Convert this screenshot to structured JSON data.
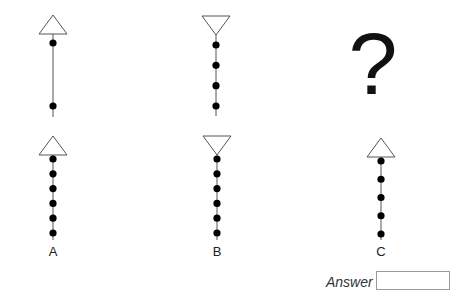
{
  "puzzle": {
    "question_mark": "?",
    "sequence": [
      {
        "id": "seq-1",
        "triangle": "up",
        "dots": 2,
        "dot_arrangement": "spread"
      },
      {
        "id": "seq-2",
        "triangle": "down",
        "dots": 4,
        "dot_arrangement": "even"
      }
    ],
    "options": [
      {
        "label": "A",
        "triangle": "up",
        "dots": 6
      },
      {
        "label": "B",
        "triangle": "down",
        "dots": 6
      },
      {
        "label": "C",
        "triangle": "up",
        "dots": 5
      }
    ]
  },
  "answer": {
    "label": "Answer",
    "value": ""
  },
  "colors": {
    "stroke": "#555555",
    "dot": "#000000",
    "triangle_fill": "#ffffff"
  }
}
